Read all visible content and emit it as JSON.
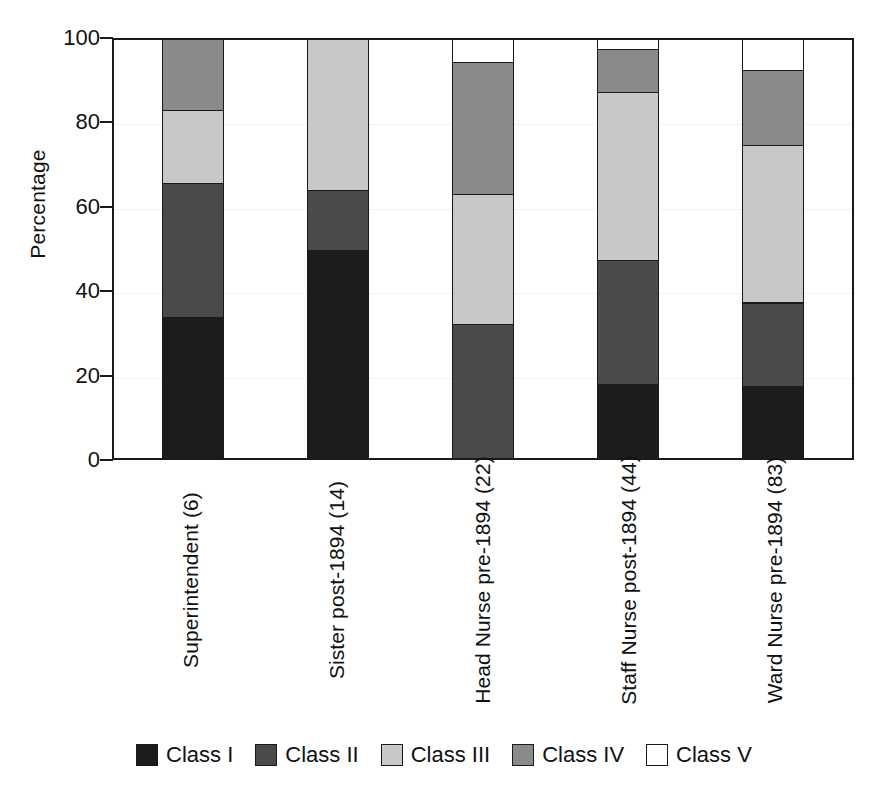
{
  "chart_data": {
    "type": "bar",
    "stacked": true,
    "title": "",
    "xlabel": "",
    "ylabel": "Percentage",
    "ylim": [
      0,
      100
    ],
    "yticks": [
      0,
      20,
      40,
      60,
      80,
      100
    ],
    "ytick_labels": [
      "0",
      "20",
      "40",
      "60",
      "80",
      "100"
    ],
    "grid": true,
    "legend_position": "bottom",
    "categories": [
      "Superintendent (6)",
      "Sister post-1894 (14)",
      "Head Nurse pre-1894 (22)",
      "Staff Nurse post-1894 (44)",
      "Ward Nurse pre-1894 (83)"
    ],
    "series": [
      {
        "name": "Class I",
        "color": "#1c1c1c",
        "values": [
          33.5,
          49.5,
          0.0,
          17.5,
          17.0
        ]
      },
      {
        "name": "Class II",
        "color": "#4a4a4a",
        "values": [
          32.0,
          14.5,
          31.8,
          29.5,
          20.0
        ]
      },
      {
        "name": "Class III",
        "color": "#c8c8c8",
        "values": [
          17.5,
          36.0,
          31.0,
          40.0,
          37.5
        ]
      },
      {
        "name": "Class IV",
        "color": "#8a8a8a",
        "values": [
          17.0,
          0.0,
          31.5,
          10.5,
          18.0
        ]
      },
      {
        "name": "Class V",
        "color": "#ffffff",
        "values": [
          0.0,
          0.0,
          5.7,
          2.5,
          7.5
        ]
      }
    ]
  },
  "legend": {
    "items": [
      {
        "label": "Class I",
        "swatch_color": "#1c1c1c",
        "icon": "legend-swatch-icon"
      },
      {
        "label": "Class II",
        "swatch_color": "#4a4a4a",
        "icon": "legend-swatch-icon"
      },
      {
        "label": "Class III",
        "swatch_color": "#c8c8c8",
        "icon": "legend-swatch-icon"
      },
      {
        "label": "Class IV",
        "swatch_color": "#8a8a8a",
        "icon": "legend-swatch-icon"
      },
      {
        "label": "Class V",
        "swatch_color": "#ffffff",
        "icon": "legend-swatch-icon"
      }
    ]
  },
  "colors": {
    "axis": "#1a1a1a",
    "grid": "#f2f2f2",
    "background": "#ffffff"
  }
}
